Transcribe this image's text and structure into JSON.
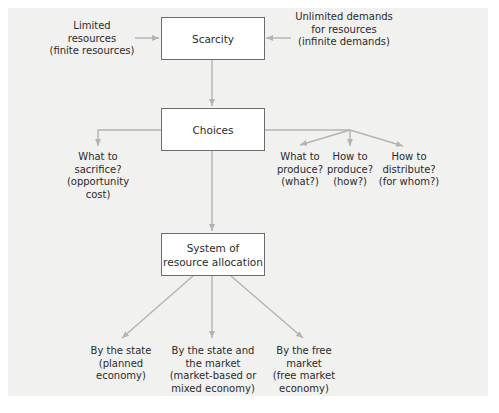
{
  "diagram": {
    "boxes": {
      "scarcity": "Scarcity",
      "choices": "Choices",
      "system_line1": "System of",
      "system_line2": "resource allocation"
    },
    "inputs": {
      "limited": [
        "Limited",
        "resources",
        "(finite resources)"
      ],
      "unlimited": [
        "Unlimited demands",
        "for resources",
        "(infinite demands)"
      ]
    },
    "choices_branches": {
      "sacrifice": [
        "What to",
        "sacrifice?",
        "(opportunity",
        "cost)"
      ],
      "what": [
        "What to",
        "produce?",
        "(what?)"
      ],
      "how": [
        "How to",
        "produce?",
        "(how?)"
      ],
      "whom": [
        "How to",
        "distribute?",
        "(for whom?)"
      ]
    },
    "allocation_branches": {
      "state": [
        "By the state",
        "(planned",
        "economy)"
      ],
      "mixed": [
        "By the state and",
        "the market",
        "(market-based or",
        "mixed economy)"
      ],
      "free": [
        "By the free",
        "market",
        "(free market",
        "economy)"
      ]
    },
    "colors": {
      "panel": "#f1f1ef",
      "arrow": "#b4b4b4",
      "box_border": "#6d6d6d",
      "text": "#2b2b2b"
    }
  }
}
